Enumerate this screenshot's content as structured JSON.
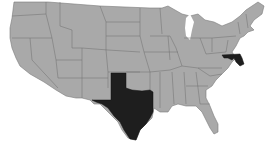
{
  "map": {
    "title": "",
    "region": "Contiguous United States",
    "base_color": "#a9a9a9",
    "border_color": "#6e6e6e",
    "highlight_color": "#1e1e1e",
    "background_color": "#ffffff",
    "highlighted_states": [
      {
        "name": "Texas",
        "abbr": "TX"
      },
      {
        "name": "Maryland",
        "abbr": "MD"
      }
    ]
  }
}
